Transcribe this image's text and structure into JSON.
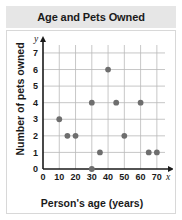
{
  "chart_data": {
    "type": "scatter",
    "title": "Age and Pets Owned",
    "xlabel": "Person's age (years)",
    "ylabel": "Number of pets owned",
    "x_axis_variable": "x",
    "y_axis_variable": "y",
    "xlim": [
      0,
      75
    ],
    "ylim": [
      0,
      7.6
    ],
    "xticks": [
      0,
      10,
      20,
      30,
      40,
      50,
      60,
      70
    ],
    "xtick_labels": [
      "0",
      "10",
      "20",
      "30",
      "40",
      "50",
      "60",
      "70"
    ],
    "yticks": [
      0,
      1,
      2,
      3,
      4,
      5,
      6,
      7
    ],
    "ytick_labels": [
      "0",
      "1",
      "2",
      "3",
      "4",
      "5",
      "6",
      "7"
    ],
    "grid": true,
    "legend": "none",
    "point_color": "#6e6e6e",
    "grid_color": "#b9b9b9",
    "axis_color": "#1a1a1a",
    "points": [
      {
        "x": 10,
        "y": 3
      },
      {
        "x": 15,
        "y": 2
      },
      {
        "x": 20,
        "y": 2
      },
      {
        "x": 30,
        "y": 0
      },
      {
        "x": 30,
        "y": 4
      },
      {
        "x": 35,
        "y": 1
      },
      {
        "x": 40,
        "y": 6
      },
      {
        "x": 45,
        "y": 4
      },
      {
        "x": 50,
        "y": 2
      },
      {
        "x": 60,
        "y": 4
      },
      {
        "x": 65,
        "y": 1
      },
      {
        "x": 70,
        "y": 1
      }
    ]
  }
}
